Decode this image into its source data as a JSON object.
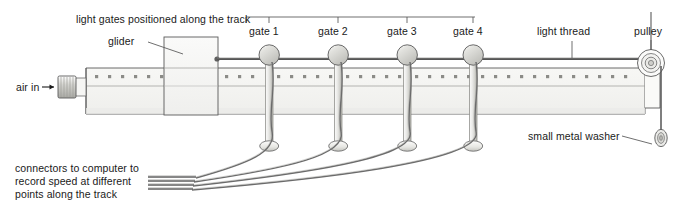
{
  "figure": {
    "title_caption": "",
    "type": "physics-apparatus-diagram"
  },
  "colors": {
    "outline": "#4a4a4a",
    "track_fill": "#f4f4f2",
    "glider_fill": "#f2f2f0",
    "gate_ball": "#d8d8d4",
    "post": "#e4e4e0",
    "cable": "#6b6b6b",
    "text": "#1a1a1a",
    "leader": "#555555",
    "background": "#ffffff"
  },
  "labels": {
    "light_gates": "light gates positioned along the track",
    "glider": "glider",
    "air_in": "air in",
    "light_thread": "light thread",
    "pulley": "pulley",
    "small_metal_washer": "small metal washer",
    "connectors": "connectors to computer to\nrecord speed at different\npoints along the track"
  },
  "gates": [
    {
      "id": "gate-1",
      "label": "gate 1",
      "x": 268
    },
    {
      "id": "gate-2",
      "label": "gate 2",
      "x": 337
    },
    {
      "id": "gate-3",
      "label": "gate 4",
      "x": 406
    },
    {
      "id": "gate-4",
      "label": "gate 4",
      "x": 472
    }
  ],
  "gate_labels": {
    "g1": "gate 1",
    "g2": "gate 2",
    "g3": "gate 3",
    "g4": "gate 4"
  },
  "arrows": {
    "air_in_direction": "right"
  }
}
